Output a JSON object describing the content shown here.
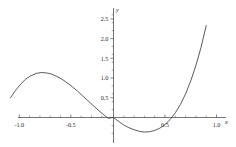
{
  "chart_data": {
    "type": "line",
    "title": "",
    "subtitle": "",
    "xlabel": "x",
    "ylabel": "y",
    "xlim": [
      -1.0,
      1.0
    ],
    "ylim": [
      -0.5,
      2.6
    ],
    "grid": false,
    "legend": false,
    "legend_position": "none",
    "axis_style": "centered-cross",
    "xticks": [
      -1.0,
      -0.5,
      0.5,
      1.0
    ],
    "xtick_labels": [
      "-1.0",
      "-0.5",
      "0.5",
      "1.0"
    ],
    "yticks": [
      0.5,
      1.0,
      1.5,
      2.0,
      2.5
    ],
    "ytick_labels": [
      "0.5",
      "1.0",
      "1.5",
      "2.0",
      "2.5"
    ],
    "x_minor_tick_step": 0.1,
    "y_minor_tick_step": 0.1,
    "curve_color": "#3d3d3d",
    "axis_color": "#3a3a3a",
    "background_color": "#ffffff",
    "annotations": [],
    "series": [
      {
        "name": "cubic",
        "expression": "y = 4x^3 + x^2 - 2x",
        "local_maximum": {
          "x": -0.65,
          "y": 1.1
        },
        "local_minimum": {
          "x": 0.31,
          "y": -0.36
        },
        "roots": [
          -0.78,
          0.0,
          0.64
        ],
        "x": [
          -1.0,
          -0.95,
          -0.9,
          -0.85,
          -0.8,
          -0.75,
          -0.7,
          -0.65,
          -0.6,
          -0.55,
          -0.5,
          -0.45,
          -0.4,
          -0.35,
          -0.3,
          -0.25,
          -0.2,
          -0.15,
          -0.1,
          -0.05,
          0.0,
          0.05,
          0.1,
          0.15,
          0.2,
          0.25,
          0.3,
          0.35,
          0.4,
          0.45,
          0.5,
          0.55,
          0.6,
          0.65,
          0.7,
          0.75,
          0.8,
          0.85,
          0.9,
          0.95,
          1.0
        ],
        "values": [
          0.5,
          0.69,
          0.85,
          0.98,
          1.06,
          1.12,
          1.14,
          1.13,
          1.1,
          1.04,
          0.97,
          0.88,
          0.78,
          0.67,
          0.55,
          0.43,
          0.31,
          0.19,
          0.08,
          -0.02,
          0.0,
          -0.1,
          -0.19,
          -0.26,
          -0.31,
          -0.35,
          -0.37,
          -0.36,
          -0.33,
          -0.27,
          -0.18,
          -0.05,
          0.12,
          0.33,
          0.6,
          0.93,
          1.32,
          1.78,
          2.33,
          2.95,
          3.0
        ]
      }
    ]
  }
}
